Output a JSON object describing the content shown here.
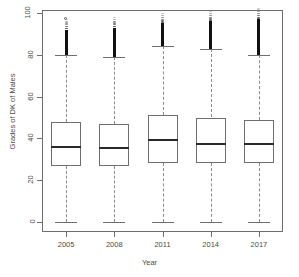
{
  "chart_data": {
    "type": "box",
    "title": "",
    "xlabel": "Year",
    "ylabel": "Grades of DK of Males",
    "categories": [
      "2005",
      "2008",
      "2011",
      "2014",
      "2017"
    ],
    "ylim": [
      0,
      100
    ],
    "yticks": [
      0,
      20,
      40,
      60,
      80,
      100
    ],
    "ytick_labels": [
      "0",
      "20",
      "40",
      "60",
      "80",
      "100"
    ],
    "xtick_labels": [
      "2005",
      "2008",
      "2011",
      "2014",
      "2017"
    ],
    "grid": false,
    "legend": "none",
    "boxes": [
      {
        "category": "2005",
        "whisker_low": 0,
        "q1": 27,
        "median": 36,
        "q3": 48,
        "whisker_high": 80,
        "outliers_high_from": 80,
        "outliers_high_to": 92,
        "isolated_outliers": [
          97
        ]
      },
      {
        "category": "2008",
        "whisker_low": 0,
        "q1": 27,
        "median": 35.5,
        "q3": 47,
        "whisker_high": 79,
        "outliers_high_from": 79,
        "outliers_high_to": 93,
        "isolated_outliers": []
      },
      {
        "category": "2011",
        "whisker_low": 0,
        "q1": 28,
        "median": 39,
        "q3": 51,
        "whisker_high": 84,
        "outliers_high_from": 84,
        "outliers_high_to": 95,
        "isolated_outliers": []
      },
      {
        "category": "2014",
        "whisker_low": 0,
        "q1": 28,
        "median": 37.5,
        "q3": 50,
        "whisker_high": 83,
        "outliers_high_from": 83,
        "outliers_high_to": 96,
        "isolated_outliers": []
      },
      {
        "category": "2017",
        "whisker_low": 0,
        "q1": 28,
        "median": 37.5,
        "q3": 49,
        "whisker_high": 80,
        "outliers_high_from": 80,
        "outliers_high_to": 97,
        "isolated_outliers": []
      }
    ]
  },
  "colors": {
    "axis": "#6e6e6e",
    "median": "#2a2a2a",
    "outlier": "#111111",
    "background": "#ffffff",
    "text": "#4a4a4a"
  }
}
